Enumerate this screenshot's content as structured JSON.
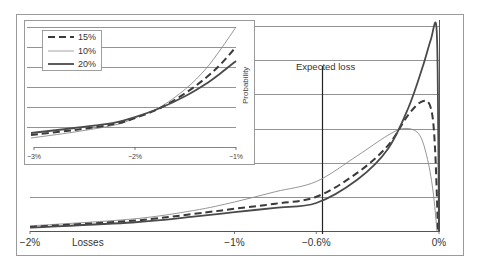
{
  "chart_data": [
    {
      "name": "main",
      "type": "line",
      "title": "",
      "xlabel": "Losses",
      "ylabel": "",
      "xlim": [
        -2.0,
        0.0
      ],
      "ylim": [
        0,
        6
      ],
      "grid": true,
      "x_ticks": [
        {
          "value": -2.0,
          "label": "−2%"
        },
        {
          "value": -1.0,
          "label": "−1%"
        },
        {
          "value": -0.6,
          "label": "−0.6%"
        },
        {
          "value": 0.0,
          "label": "0%"
        }
      ],
      "annotations": [
        {
          "type": "vline",
          "x": -0.6,
          "label": "Expected loss"
        }
      ],
      "legend": [
        "15%",
        "10%",
        "20%"
      ],
      "series": [
        {
          "name": "10%",
          "style": "thin",
          "color": "#8a8a8a",
          "points": [
            [
              -2.0,
              0.15
            ],
            [
              -1.5,
              0.35
            ],
            [
              -1.2,
              0.6
            ],
            [
              -1.0,
              0.85
            ],
            [
              -0.8,
              1.15
            ],
            [
              -0.6,
              1.45
            ],
            [
              -0.4,
              2.2
            ],
            [
              -0.25,
              2.8
            ],
            [
              -0.17,
              3.0
            ],
            [
              -0.1,
              2.85
            ],
            [
              -0.06,
              2.2
            ],
            [
              -0.03,
              1.2
            ],
            [
              -0.01,
              0.0
            ]
          ]
        },
        {
          "name": "15%",
          "style": "dashed",
          "color": "#3a3a3a",
          "points": [
            [
              -2.0,
              0.12
            ],
            [
              -1.5,
              0.3
            ],
            [
              -1.2,
              0.5
            ],
            [
              -1.0,
              0.65
            ],
            [
              -0.8,
              0.8
            ],
            [
              -0.6,
              1.0
            ],
            [
              -0.4,
              1.7
            ],
            [
              -0.25,
              2.5
            ],
            [
              -0.15,
              3.4
            ],
            [
              -0.08,
              3.8
            ],
            [
              -0.04,
              3.6
            ],
            [
              -0.02,
              2.5
            ],
            [
              -0.005,
              0.0
            ]
          ]
        },
        {
          "name": "20%",
          "style": "thick",
          "color": "#4a4a4a",
          "points": [
            [
              -2.0,
              0.1
            ],
            [
              -1.5,
              0.25
            ],
            [
              -1.2,
              0.42
            ],
            [
              -1.0,
              0.55
            ],
            [
              -0.8,
              0.68
            ],
            [
              -0.6,
              0.82
            ],
            [
              -0.4,
              1.5
            ],
            [
              -0.25,
              2.4
            ],
            [
              -0.15,
              3.6
            ],
            [
              -0.08,
              4.8
            ],
            [
              -0.04,
              5.6
            ],
            [
              -0.012,
              5.95
            ],
            [
              -0.004,
              3.0
            ],
            [
              0.0,
              0.0
            ]
          ]
        }
      ]
    },
    {
      "name": "inset",
      "type": "line",
      "title": "",
      "xlabel": "",
      "ylabel": "Probability",
      "xlim": [
        -3.0,
        -1.0
      ],
      "ylim": [
        0,
        6
      ],
      "grid": true,
      "x_ticks": [
        {
          "value": -3.0,
          "label": "−3%"
        },
        {
          "value": -2.0,
          "label": "−2%"
        },
        {
          "value": -1.0,
          "label": "−1%"
        }
      ],
      "legend": [
        "15%",
        "10%",
        "20%"
      ],
      "series": [
        {
          "name": "10%",
          "style": "thin",
          "color": "#8a8a8a",
          "points": [
            [
              -3.03,
              0.45
            ],
            [
              -2.6,
              0.75
            ],
            [
              -2.2,
              1.1
            ],
            [
              -2.0,
              1.45
            ],
            [
              -1.75,
              2.0
            ],
            [
              -1.5,
              2.9
            ],
            [
              -1.3,
              3.9
            ],
            [
              -1.15,
              4.9
            ],
            [
              -1.0,
              6.0
            ]
          ]
        },
        {
          "name": "15%",
          "style": "dashed",
          "color": "#3a3a3a",
          "points": [
            [
              -3.03,
              0.6
            ],
            [
              -2.6,
              0.85
            ],
            [
              -2.2,
              1.15
            ],
            [
              -2.0,
              1.45
            ],
            [
              -1.75,
              1.95
            ],
            [
              -1.5,
              2.7
            ],
            [
              -1.3,
              3.45
            ],
            [
              -1.15,
              4.15
            ],
            [
              -1.0,
              5.0
            ]
          ]
        },
        {
          "name": "20%",
          "style": "thick",
          "color": "#4a4a4a",
          "points": [
            [
              -3.03,
              0.7
            ],
            [
              -2.6,
              0.95
            ],
            [
              -2.2,
              1.22
            ],
            [
              -2.0,
              1.5
            ],
            [
              -1.75,
              1.95
            ],
            [
              -1.5,
              2.55
            ],
            [
              -1.3,
              3.15
            ],
            [
              -1.15,
              3.7
            ],
            [
              -1.0,
              4.3
            ]
          ]
        }
      ]
    }
  ],
  "labels": {
    "expected_loss": "Expected loss",
    "losses": "Losses",
    "probability": "Probability",
    "main_ticks": [
      "−2%",
      "−1%",
      "−0.6%",
      "0%"
    ],
    "inset_ticks": [
      "−3%",
      "−2%",
      "−1%"
    ],
    "legend": [
      "15%",
      "10%",
      "20%"
    ]
  }
}
